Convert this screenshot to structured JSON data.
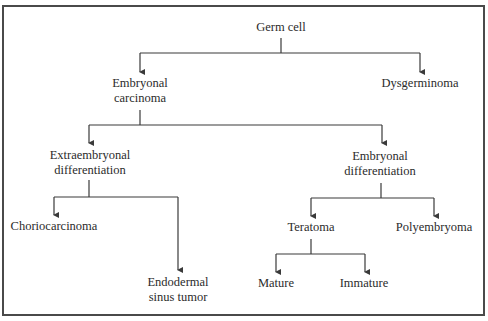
{
  "diagram": {
    "type": "tree",
    "nodes": {
      "root": {
        "lines": [
          "Germ cell"
        ]
      },
      "embryonal_carcinoma": {
        "lines": [
          "Embryonal",
          "carcinoma"
        ]
      },
      "dysgerminoma": {
        "lines": [
          "Dysgerminoma"
        ]
      },
      "extraembryonal": {
        "lines": [
          "Extraembryonal",
          "differentiation"
        ]
      },
      "embryonal_diff": {
        "lines": [
          "Embryonal",
          "differentiation"
        ]
      },
      "choriocarcinoma": {
        "lines": [
          "Choriocarcinoma"
        ]
      },
      "endodermal": {
        "lines": [
          "Endodermal",
          "sinus tumor"
        ]
      },
      "teratoma": {
        "lines": [
          "Teratoma"
        ]
      },
      "polyembryoma": {
        "lines": [
          "Polyembryoma"
        ]
      },
      "mature": {
        "lines": [
          "Mature"
        ]
      },
      "immature": {
        "lines": [
          "Immature"
        ]
      }
    },
    "edges": [
      [
        "Germ cell",
        "Embryonal carcinoma"
      ],
      [
        "Germ cell",
        "Dysgerminoma"
      ],
      [
        "Embryonal carcinoma",
        "Extraembryonal differentiation"
      ],
      [
        "Embryonal carcinoma",
        "Embryonal differentiation"
      ],
      [
        "Extraembryonal differentiation",
        "Choriocarcinoma"
      ],
      [
        "Extraembryonal differentiation",
        "Endodermal sinus tumor"
      ],
      [
        "Embryonal differentiation",
        "Teratoma"
      ],
      [
        "Embryonal differentiation",
        "Polyembryoma"
      ],
      [
        "Teratoma",
        "Mature"
      ],
      [
        "Teratoma",
        "Immature"
      ]
    ],
    "colors": {
      "line": "#3a3a3a",
      "text": "#2b2b2b",
      "frame": "#4a4a4a"
    }
  }
}
